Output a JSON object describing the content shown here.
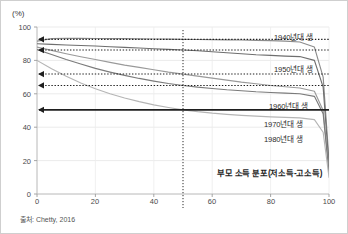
{
  "figure": {
    "unit_label": "(%)",
    "source_note": "출처: Chetty, 2016",
    "xaxis_title": "부모 소득 분포(저소득-고소득)",
    "background": "#ffffff",
    "border_color": "#cfcfcf"
  },
  "axes": {
    "y_ticks": [
      "100",
      "80",
      "60",
      "40",
      "20",
      "0"
    ],
    "x_ticks": [
      "0",
      "20",
      "40",
      "60",
      "80",
      "100"
    ]
  },
  "series_labels": [
    {
      "text": "1940년대 생"
    },
    {
      "text": "1950년대 생"
    },
    {
      "text": "1960년대 생"
    },
    {
      "text": "1970년대 생"
    },
    {
      "text": "1980년대 생"
    }
  ],
  "chart_data": {
    "type": "line",
    "title": "",
    "subtitle": "",
    "xlabel": "부모 소득 분포(저소득-고소득)",
    "ylabel": "(%)",
    "unit": "%",
    "xlim": [
      0,
      100
    ],
    "ylim": [
      0,
      100
    ],
    "xticks": [
      0,
      20,
      40,
      60,
      80,
      100
    ],
    "yticks": [
      0,
      20,
      40,
      60,
      80,
      100
    ],
    "grid": true,
    "legend_position": "inline-right-labels",
    "annotation_note": "출처: Chetty, 2016",
    "x": [
      0,
      5,
      10,
      15,
      20,
      25,
      30,
      35,
      40,
      45,
      50,
      55,
      60,
      65,
      70,
      75,
      80,
      85,
      90,
      95,
      98,
      100
    ],
    "series": [
      {
        "name": "1940년대 생",
        "color": "#8c8c8c",
        "values": [
          91.5,
          93.0,
          93.2,
          93.2,
          93.1,
          93.0,
          93.0,
          92.9,
          92.8,
          92.7,
          92.6,
          92.5,
          92.4,
          92.3,
          92.2,
          92.0,
          91.8,
          91.5,
          91.0,
          88.0,
          70.0,
          20.0
        ]
      },
      {
        "name": "1950년대 생",
        "color": "#6e6e6e",
        "values": [
          90.0,
          89.6,
          89.2,
          88.9,
          88.6,
          88.2,
          87.8,
          87.4,
          87.0,
          86.6,
          86.2,
          85.8,
          85.2,
          84.6,
          84.0,
          83.4,
          83.0,
          82.6,
          82.3,
          80.0,
          64.0,
          17.0
        ]
      },
      {
        "name": "1960년대 생",
        "color": "#9a9a9a",
        "values": [
          88.0,
          86.0,
          84.0,
          82.2,
          80.5,
          78.8,
          77.2,
          75.8,
          74.4,
          73.0,
          71.8,
          70.6,
          69.4,
          68.2,
          67.0,
          66.0,
          65.0,
          64.2,
          63.5,
          61.5,
          50.0,
          14.0
        ]
      },
      {
        "name": "1970년대 생",
        "color": "#7b7b7b",
        "values": [
          86.5,
          83.5,
          80.5,
          77.8,
          75.2,
          73.0,
          71.0,
          69.2,
          67.6,
          66.2,
          65.0,
          64.0,
          63.2,
          62.4,
          61.8,
          61.2,
          60.8,
          60.4,
          60.0,
          58.5,
          48.0,
          13.0
        ]
      },
      {
        "name": "1980년대 생",
        "color": "#b5b5b5",
        "values": [
          80.0,
          75.0,
          70.5,
          66.5,
          63.0,
          60.0,
          57.5,
          55.3,
          53.4,
          51.8,
          50.4,
          49.3,
          48.4,
          47.7,
          47.1,
          46.6,
          46.2,
          45.9,
          45.6,
          44.5,
          37.0,
          10.0
        ]
      }
    ],
    "reference_lines": {
      "horizontal": [
        {
          "value": 92.6,
          "label": "1940년대 생 at p50",
          "style": "dotted",
          "arrow": "left"
        },
        {
          "value": 86.2,
          "label": "1950년대 생 at p50",
          "style": "dotted",
          "arrow": "left"
        },
        {
          "value": 71.8,
          "label": "1960년대 생 at p50",
          "style": "dotted",
          "arrow": "left"
        },
        {
          "value": 65.0,
          "label": "1970년대 생 at p50",
          "style": "dotted",
          "arrow": "left"
        },
        {
          "value": 50.4,
          "label": "1980년대 생 at p50",
          "style": "solid",
          "arrow": "left"
        }
      ],
      "vertical": [
        {
          "value": 50,
          "style": "dotted"
        }
      ]
    }
  }
}
